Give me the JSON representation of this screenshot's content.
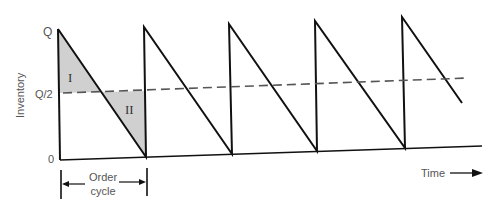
{
  "diagram": {
    "y_axis": {
      "label": "Inventory",
      "ticks": [
        {
          "label": "Q",
          "y": 31
        },
        {
          "label": "Q/2",
          "y": 94
        },
        {
          "label": "0",
          "y": 159
        }
      ]
    },
    "x_axis": {
      "label": "Time"
    },
    "regions": [
      {
        "label": "I",
        "x": 80,
        "y": 78
      },
      {
        "label": "II",
        "x": 130,
        "y": 114
      }
    ],
    "order_cycle": {
      "line1": "Order",
      "line2": "cycle"
    },
    "average_line_label": "Q/2",
    "colors": {
      "line": "#111111",
      "shade": "#d0d0d0",
      "dash": "#555555",
      "text": "#555555"
    }
  }
}
